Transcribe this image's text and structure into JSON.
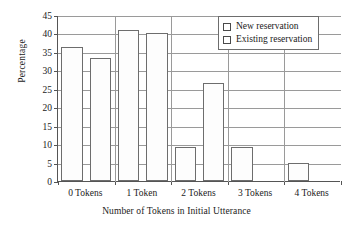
{
  "chart_data": {
    "type": "bar",
    "title": "",
    "xlabel": "Number of Tokens in Initial Utterance",
    "ylabel": "Percentage",
    "categories": [
      "0 Tokens",
      "1 Token",
      "2 Tokens",
      "3 Tokens",
      "4 Tokens"
    ],
    "series": [
      {
        "name": "New reservation",
        "values": [
          36.3,
          41.0,
          9.3,
          9.3,
          4.8
        ]
      },
      {
        "name": "Existing reservation",
        "values": [
          33.3,
          40.2,
          26.6,
          0,
          0
        ]
      }
    ],
    "ylim": [
      0,
      45
    ],
    "ytick_step": 5,
    "yticks": [
      "0",
      "5",
      "10",
      "15",
      "20",
      "25",
      "30",
      "35",
      "40",
      "45"
    ],
    "grid": "horizontal",
    "legend_position": "top-right",
    "bar_fill_color": "#fdfdfd",
    "bar_border_color": "#6d6d6d",
    "grid_color": "#9a9a9a",
    "axis_color": "#555555"
  }
}
